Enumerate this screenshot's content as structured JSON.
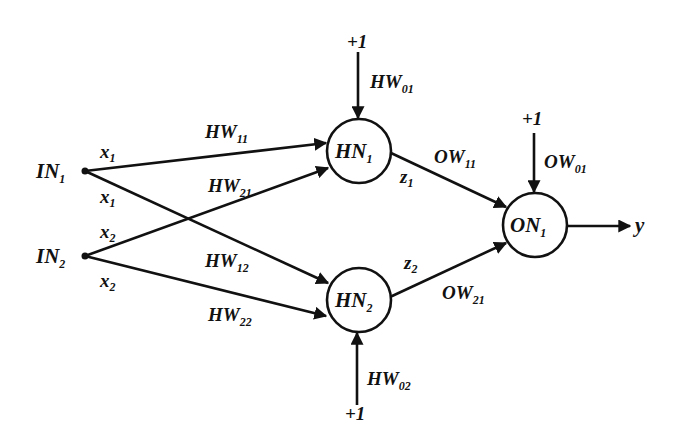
{
  "diagram": {
    "type": "neural-network",
    "colors": {
      "background": "#ffffff",
      "stroke": "#111111"
    },
    "inputs": [
      {
        "id": "IN1",
        "label": "IN",
        "sub": "1",
        "x": 85,
        "y": 171
      },
      {
        "id": "IN2",
        "label": "IN",
        "sub": "2",
        "x": 85,
        "y": 256
      }
    ],
    "hidden": [
      {
        "id": "HN1",
        "label": "HN",
        "sub": "1",
        "cx": 359,
        "cy": 151,
        "r": 32
      },
      {
        "id": "HN2",
        "label": "HN",
        "sub": "2",
        "cx": 359,
        "cy": 300,
        "r": 32
      }
    ],
    "output": [
      {
        "id": "ON1",
        "label": "ON",
        "sub": "1",
        "cx": 535,
        "cy": 225,
        "r": 32
      }
    ],
    "input_signals": [
      {
        "label": "x",
        "sub": "1",
        "x": 100,
        "y": 158
      },
      {
        "label": "x",
        "sub": "1",
        "x": 100,
        "y": 203
      },
      {
        "label": "x",
        "sub": "2",
        "x": 100,
        "y": 238
      },
      {
        "label": "x",
        "sub": "2",
        "x": 100,
        "y": 287
      }
    ],
    "hidden_weights": [
      {
        "label": "HW",
        "sub": "11",
        "x": 205,
        "y": 138
      },
      {
        "label": "HW",
        "sub": "21",
        "x": 208,
        "y": 192
      },
      {
        "label": "HW",
        "sub": "12",
        "x": 205,
        "y": 267
      },
      {
        "label": "HW",
        "sub": "22",
        "x": 208,
        "y": 321
      }
    ],
    "bias": {
      "hn1": {
        "value": "+1",
        "weight": "HW",
        "weight_sub": "01"
      },
      "hn2": {
        "value": "+1",
        "weight": "HW",
        "weight_sub": "02"
      },
      "on1": {
        "value": "+1",
        "weight": "OW",
        "weight_sub": "01"
      }
    },
    "hidden_outputs": [
      {
        "label": "z",
        "sub": "1"
      },
      {
        "label": "z",
        "sub": "2"
      }
    ],
    "output_weights": [
      {
        "label": "OW",
        "sub": "11"
      },
      {
        "label": "OW",
        "sub": "21"
      }
    ],
    "final_output": {
      "label": "y"
    }
  }
}
